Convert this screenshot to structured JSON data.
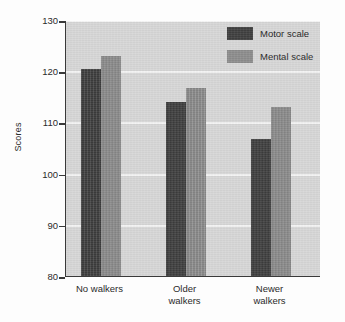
{
  "chart_data": {
    "type": "bar",
    "title": "",
    "xlabel": "",
    "ylabel": "Scores",
    "ylim": [
      80,
      130
    ],
    "yticks": [
      80,
      90,
      100,
      110,
      120,
      130
    ],
    "ytick_labels": [
      "80",
      "90",
      "100",
      "110",
      "120",
      "130"
    ],
    "grid": "horizontal",
    "legend_position": "top-right",
    "categories": [
      "No walkers",
      "Older walkers",
      "Newer walkers"
    ],
    "category_lines": [
      [
        "No walkers"
      ],
      [
        "Older",
        "walkers"
      ],
      [
        "Newer",
        "walkers"
      ]
    ],
    "series": [
      {
        "name": "Motor scale",
        "color": "#3f3f3f",
        "values": [
          120.5,
          114.0,
          106.8
        ]
      },
      {
        "name": "Mental scale",
        "color": "#8d8d8d",
        "values": [
          123.0,
          116.7,
          113.0
        ]
      }
    ]
  },
  "legend": {
    "items": [
      {
        "label": "Motor scale",
        "color": "#3f3f3f"
      },
      {
        "label": "Mental scale",
        "color": "#8d8d8d"
      }
    ]
  },
  "axes": {
    "y_title": "Scores",
    "y_tick_labels": [
      "130",
      "120",
      "110",
      "100",
      "90",
      "80"
    ],
    "x_tick_labels": [
      "No walkers",
      "Older walkers",
      "Newer walkers"
    ]
  },
  "style": {
    "plot_background": "#d7d7d7",
    "gridline_color": "#f3f3f3",
    "axis_color": "#3a3a3a",
    "page_background": "#fdfdfd"
  }
}
